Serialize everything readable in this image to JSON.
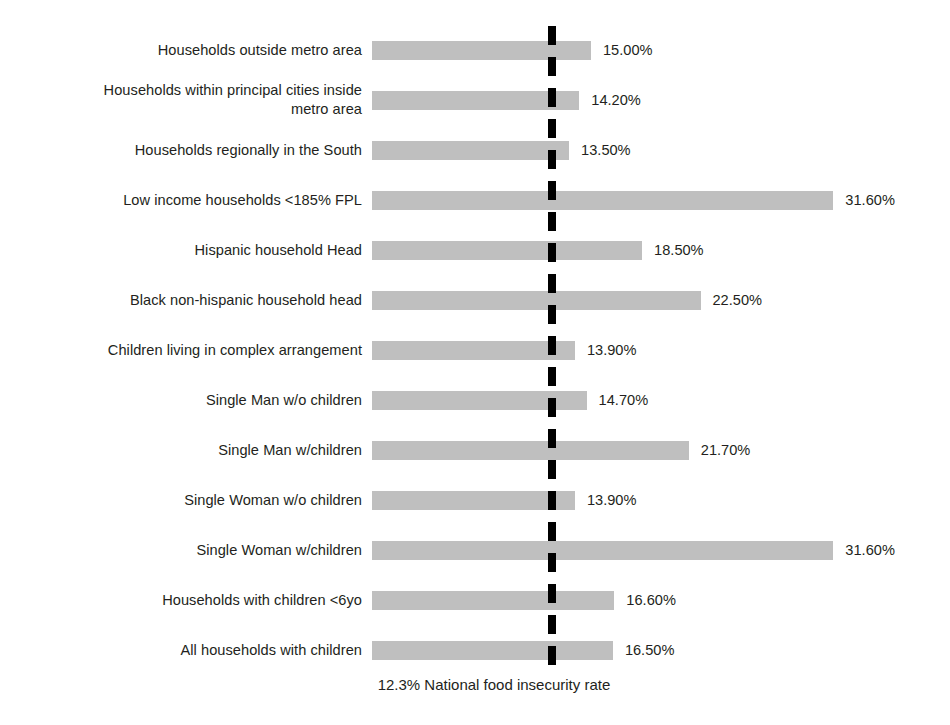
{
  "chart_data": {
    "type": "bar",
    "orientation": "horizontal",
    "title": "",
    "xlabel": "",
    "ylabel": "",
    "xlim": [
      0,
      33
    ],
    "grid": false,
    "legend": "none",
    "value_suffix": "%",
    "categories": [
      "Households outside metro area",
      "Households within principal cities inside\nmetro area",
      "Households regionally in the South",
      "Low income households <185% FPL",
      "Hispanic household Head",
      "Black non-hispanic household head",
      "Children living in complex arrangement",
      "Single Man w/o children",
      "Single Man w/children",
      "Single Woman w/o children",
      "Single Woman w/children",
      "Households with children <6yo",
      "All households with children"
    ],
    "values": [
      15.0,
      14.2,
      13.5,
      31.6,
      18.5,
      22.5,
      13.9,
      14.7,
      21.7,
      13.9,
      31.6,
      16.6,
      16.5
    ],
    "value_labels": [
      "15.00%",
      "14.20%",
      "13.50%",
      "31.60%",
      "18.50%",
      "22.50%",
      "13.90%",
      "14.70%",
      "21.70%",
      "13.90%",
      "31.60%",
      "16.60%",
      "16.50%"
    ],
    "bar_color": "#bfbfbf",
    "reference_line": {
      "value": 12.3,
      "label": "12.3% National food insecurity rate",
      "color": "#000000",
      "style": "dashed"
    }
  }
}
